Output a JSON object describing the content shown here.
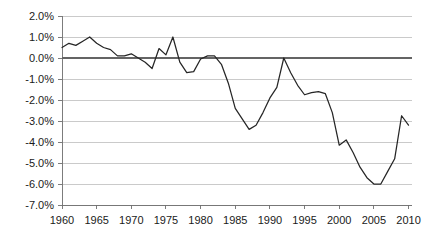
{
  "chart_data": {
    "type": "line",
    "title": "",
    "subtitle": "",
    "xlabel": "",
    "ylabel": "",
    "xlim": [
      1960,
      2010.5
    ],
    "ylim": [
      -7.0,
      2.0
    ],
    "grid": true,
    "legend": false,
    "legend_position": "none",
    "y_tick_labels": [
      "2.0%",
      "1.0%",
      "0.0%",
      "-1.0%",
      "-2.0%",
      "-3.0%",
      "-4.0%",
      "-5.0%",
      "-6.0%",
      "-7.0%"
    ],
    "y_tick_values": [
      2.0,
      1.0,
      0.0,
      -1.0,
      -2.0,
      -3.0,
      -4.0,
      -5.0,
      -6.0,
      -7.0
    ],
    "x_tick_labels": [
      "1960",
      "1965",
      "1970",
      "1975",
      "1980",
      "1985",
      "1990",
      "1995",
      "2000",
      "2005",
      "2010"
    ],
    "x_tick_values": [
      1960,
      1965,
      1970,
      1975,
      1980,
      1985,
      1990,
      1995,
      2000,
      2005,
      2010
    ],
    "zero_reference_line": 0.0,
    "units": "percent",
    "series": [
      {
        "name": "value",
        "color": "#262626",
        "x": [
          1960,
          1961,
          1962,
          1963,
          1964,
          1965,
          1966,
          1967,
          1968,
          1969,
          1970,
          1971,
          1972,
          1973,
          1974,
          1975,
          1976,
          1977,
          1978,
          1979,
          1980,
          1981,
          1982,
          1983,
          1984,
          1985,
          1986,
          1987,
          1988,
          1989,
          1990,
          1991,
          1992,
          1993,
          1994,
          1995,
          1996,
          1997,
          1998,
          1999,
          2000,
          2001,
          2002,
          2003,
          2004,
          2005,
          2006,
          2007,
          2008,
          2009,
          2010
        ],
        "values": [
          0.5,
          0.7,
          0.6,
          0.8,
          1.0,
          0.7,
          0.5,
          0.4,
          0.1,
          0.1,
          0.2,
          0.0,
          -0.2,
          -0.5,
          0.45,
          0.15,
          1.0,
          -0.2,
          -0.7,
          -0.65,
          -0.05,
          0.1,
          0.1,
          -0.3,
          -1.2,
          -2.4,
          -2.9,
          -3.4,
          -3.2,
          -2.6,
          -1.9,
          -1.4,
          0.0,
          -0.7,
          -1.3,
          -1.75,
          -1.65,
          -1.6,
          -1.7,
          -2.6,
          -4.15,
          -3.9,
          -4.5,
          -5.2,
          -5.7,
          -6.0,
          -6.0,
          -5.4,
          -4.8,
          -2.75,
          -3.2
        ]
      }
    ]
  },
  "plot_geometry": {
    "left_px": 62,
    "right_px": 412,
    "top_px": 16,
    "bottom_px": 205
  }
}
